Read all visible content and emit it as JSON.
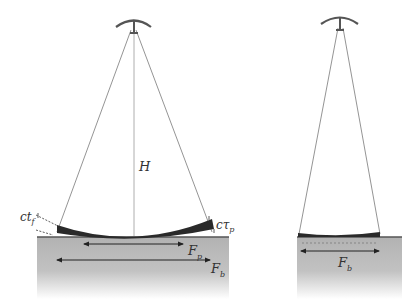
{
  "diagram": {
    "left_panel": {
      "labels": {
        "height": "H",
        "contact_left_base": "ct",
        "contact_left_sub": "f",
        "contact_right_base": "cτ",
        "contact_right_sub": "p",
        "force_p_base": "F",
        "force_p_sub": "p",
        "force_b_base": "F",
        "force_b_sub": "b"
      }
    },
    "right_panel": {
      "labels": {
        "force_b_base": "F",
        "force_b_sub": "b"
      }
    },
    "colors": {
      "ground_top": "#b4b4b4",
      "ground_bottom": "#ffffff",
      "surface_line": "#555555",
      "plate": "#2a2a2a",
      "lines": "#777777"
    }
  }
}
